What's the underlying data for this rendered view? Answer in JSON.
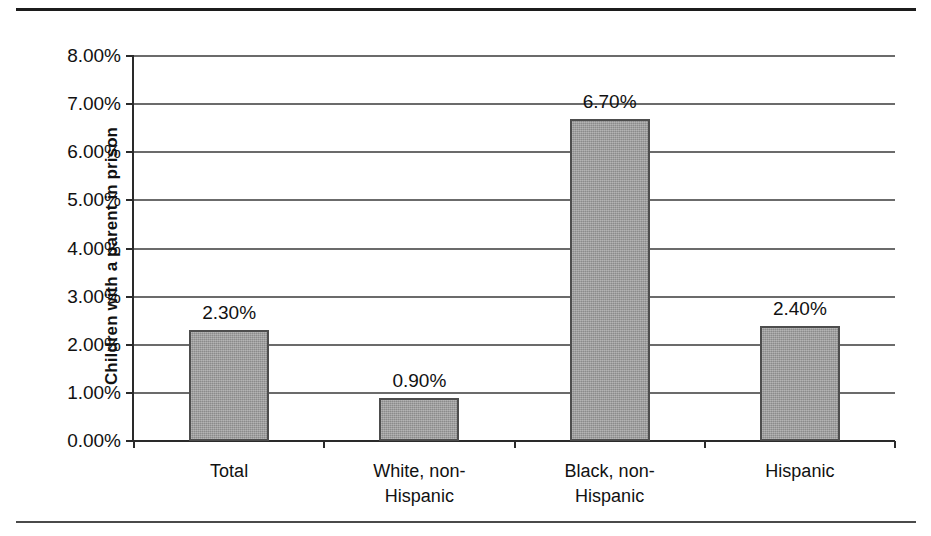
{
  "chart_data": {
    "type": "bar",
    "title": "",
    "xlabel": "",
    "ylabel": "Children with a parent in prison",
    "categories": [
      "Total",
      "White, non-\nHispanic",
      "Black, non-\nHispanic",
      "Hispanic"
    ],
    "values": [
      2.3,
      0.9,
      6.7,
      2.4
    ],
    "value_labels": [
      "2.30%",
      "0.90%",
      "6.70%",
      "2.40%"
    ],
    "ylim": [
      0,
      8
    ],
    "ytick_values": [
      0,
      1,
      2,
      3,
      4,
      5,
      6,
      7,
      8
    ],
    "ytick_labels": [
      "0.00%",
      "1.00%",
      "2.00%",
      "3.00%",
      "4.00%",
      "5.00%",
      "6.00%",
      "7.00%",
      "8.00%"
    ],
    "grid": true,
    "legend": false,
    "legend_position": "none",
    "series": [
      {
        "name": "Children with a parent in prison",
        "values": [
          2.3,
          0.9,
          6.7,
          2.4
        ]
      }
    ],
    "colors": {
      "bar_fill": "#9a9a9a",
      "bar_edge": "#4d4d4d",
      "gridline": "#6b6b6b",
      "axis": "#2a2a2a",
      "text": "#111111",
      "background": "#ffffff",
      "rule_top": "#1c1c1c",
      "rule_bottom": "#4a4a4a"
    }
  }
}
